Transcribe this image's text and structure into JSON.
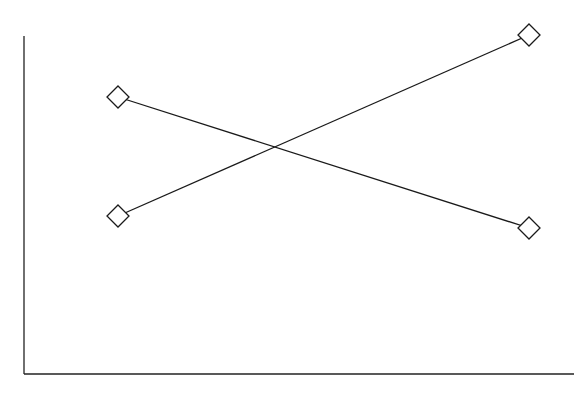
{
  "chart_data": {
    "type": "line",
    "title": "",
    "xlabel": "",
    "ylabel": "",
    "categories": [
      "Level 1",
      "Level 2"
    ],
    "x_pixels": [
      118,
      529
    ],
    "series": [
      {
        "name": "Series A (decreasing)",
        "values": [
          0.78,
          0.42
        ],
        "marker": "diamond-open",
        "pixel_points": [
          [
            118,
            97
          ],
          [
            529,
            228
          ]
        ]
      },
      {
        "name": "Series B (increasing)",
        "values": [
          0.44,
          0.99
        ],
        "marker": "diamond-open",
        "pixel_points": [
          [
            118,
            216
          ],
          [
            529,
            35
          ]
        ]
      }
    ],
    "ylim": [
      0,
      1
    ],
    "grid": false,
    "legend": null,
    "tick_labels": false,
    "axes": {
      "y_axis": {
        "x": 24,
        "y_top": 36,
        "y_bottom": 374
      },
      "x_axis": {
        "y": 374,
        "x_left": 24,
        "x_right": 574
      }
    },
    "colors": {
      "line": "#1a1a1a",
      "marker_fill": "#ffffff",
      "background": "#ffffff"
    }
  }
}
